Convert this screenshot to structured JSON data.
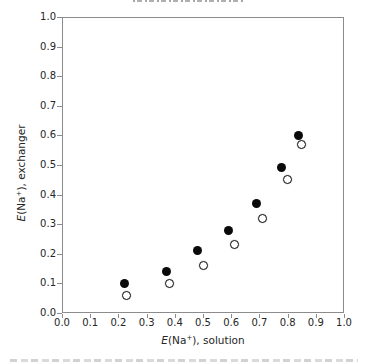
{
  "chart_data": {
    "type": "scatter",
    "title": "",
    "xlabel": "E(Na+), solution",
    "ylabel": "E(Na+), exchanger",
    "xlim": [
      0.0,
      1.0
    ],
    "ylim": [
      0.0,
      1.0
    ],
    "xticks": [
      "0.0",
      "0.1",
      "0.2",
      "0.3",
      "0.4",
      "0.5",
      "0.6",
      "0.7",
      "0.8",
      "0.9",
      "1.0"
    ],
    "yticks": [
      "0.0",
      "0.1",
      "0.2",
      "0.3",
      "0.4",
      "0.5",
      "0.6",
      "0.7",
      "0.8",
      "0.9",
      "1.0"
    ],
    "grid": false,
    "legend_position": "none",
    "series": [
      {
        "name": "filled-circles",
        "marker": "filled-circle",
        "color": "#000000",
        "points": [
          [
            0.22,
            0.1
          ],
          [
            0.37,
            0.14
          ],
          [
            0.48,
            0.21
          ],
          [
            0.59,
            0.28
          ],
          [
            0.69,
            0.37
          ],
          [
            0.78,
            0.49
          ],
          [
            0.84,
            0.6
          ]
        ]
      },
      {
        "name": "open-circles",
        "marker": "open-circle",
        "color": "#ffffff",
        "stroke": "#000000",
        "points": [
          [
            0.23,
            0.06
          ],
          [
            0.38,
            0.1
          ],
          [
            0.5,
            0.16
          ],
          [
            0.61,
            0.23
          ],
          [
            0.71,
            0.32
          ],
          [
            0.8,
            0.45
          ],
          [
            0.85,
            0.57
          ]
        ]
      }
    ]
  },
  "axis_label_parts": {
    "x": {
      "e": "E",
      "open": "(Na",
      "sup": "+",
      "close": "), solution"
    },
    "y": {
      "e": "E",
      "open": "(Na",
      "sup": "+",
      "close": "), exchanger"
    }
  },
  "colors": {
    "axis_line": "#8c8c8c",
    "tick_label": "#262626",
    "marker_fill": "#000000",
    "marker_open_fill": "#ffffff",
    "background": "#ffffff"
  }
}
